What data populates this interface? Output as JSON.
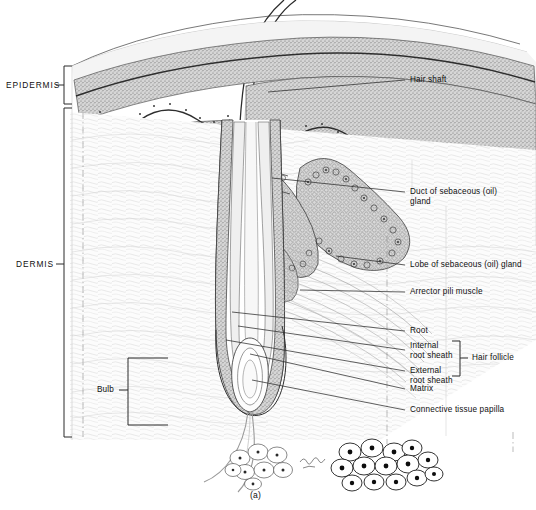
{
  "figure": {
    "caption": "(a)",
    "artist_signature": "Kibbe",
    "style": "pen-and-ink anatomical line drawing, grayscale stipple"
  },
  "layers": {
    "epidermis_label": "EPIDERMIS",
    "dermis_label": "DERMIS"
  },
  "labels": {
    "hair_shaft": "Hair shaft",
    "duct_line1": "Duct of sebaceous (oil)",
    "duct_line2": "gland",
    "lobe": "Lobe of sebaceous (oil) gland",
    "arrector": "Arrector pili muscle",
    "root": "Root",
    "internal_line1": "Internal",
    "internal_line2": "root sheath",
    "external_line1": "External",
    "external_line2": "root sheath",
    "hair_follicle": "Hair follicle",
    "matrix": "Matrix",
    "papilla": "Connective tissue papilla",
    "bulb": "Bulb"
  },
  "colors": {
    "ink": "#1a1a1a",
    "line": "#4a4a4a",
    "epidermis_fill": "#bdbdbd",
    "basal_line": "#333333",
    "dermis_fill": "#fbfbfb",
    "gland_fill": "#cfcfcf",
    "hypodermis_fill": "#ffffff",
    "background": "#ffffff"
  },
  "structures": [
    {
      "name": "hair-shaft",
      "region": "above epidermis, emerging upper centre"
    },
    {
      "name": "epidermis-band",
      "region": "stippled band across top of block"
    },
    {
      "name": "sebaceous-gland-lobes",
      "region": "mid-right, cellular lobules"
    },
    {
      "name": "sebaceous-duct",
      "region": "connects gland to follicle"
    },
    {
      "name": "arrector-pili-muscle",
      "region": "diagonal fibre band to follicle"
    },
    {
      "name": "hair-root",
      "region": "follicle shaft below skin"
    },
    {
      "name": "internal-root-sheath",
      "region": "inner follicle wall"
    },
    {
      "name": "external-root-sheath",
      "region": "outer follicle wall"
    },
    {
      "name": "hair-bulb",
      "region": "expanded base of follicle"
    },
    {
      "name": "matrix",
      "region": "germinal cells at bulb base"
    },
    {
      "name": "connective-tissue-papilla",
      "region": "dermal papilla inside bulb"
    },
    {
      "name": "adipose-cells-left",
      "region": "pale fat cell cluster, lower centre"
    },
    {
      "name": "adipose-cells-right",
      "region": "dark-nuclei fat cell cluster, lower right"
    }
  ]
}
